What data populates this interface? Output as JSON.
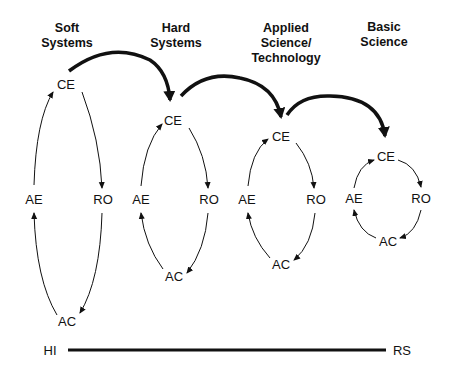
{
  "diagram": {
    "stages": [
      {
        "title_line1": "Soft",
        "title_line2": "Systems",
        "title_line3": "",
        "ce": "CE",
        "ae": "AE",
        "ro": "RO",
        "ac": "AC"
      },
      {
        "title_line1": "Hard",
        "title_line2": "Systems",
        "title_line3": "",
        "ce": "CE",
        "ae": "AE",
        "ro": "RO",
        "ac": "AC"
      },
      {
        "title_line1": "Applied",
        "title_line2": "Science/",
        "title_line3": "Technology",
        "ce": "CE",
        "ae": "AE",
        "ro": "RO",
        "ac": "AC"
      },
      {
        "title_line1": "Basic",
        "title_line2": "Science",
        "title_line3": "",
        "ce": "CE",
        "ae": "AE",
        "ro": "RO",
        "ac": "AC"
      }
    ],
    "axis": {
      "left_label": "HI",
      "right_label": "RS"
    },
    "colors": {
      "ink": "#111111",
      "background": "#ffffff"
    }
  }
}
